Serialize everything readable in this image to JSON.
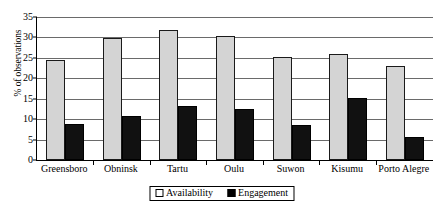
{
  "chart_data": {
    "type": "bar",
    "title": "",
    "xlabel": "",
    "ylabel": "% of observations",
    "ylim": [
      0,
      35
    ],
    "ytick_step": 5,
    "yticks": [
      0,
      5,
      10,
      15,
      20,
      25,
      30,
      35
    ],
    "grid": true,
    "legend_position": "bottom-center",
    "categories": [
      "Greensboro",
      "Obninsk",
      "Tartu",
      "Oulu",
      "Suwon",
      "Kisumu",
      "Porto Alegre"
    ],
    "series": [
      {
        "name": "Availability",
        "color": "#d4d4d4",
        "values": [
          24.4,
          29.9,
          31.8,
          30.4,
          25.3,
          26.0,
          23.1
        ]
      },
      {
        "name": "Engagement",
        "color": "#111111",
        "values": [
          8.9,
          10.8,
          13.1,
          12.5,
          8.5,
          15.1,
          5.6
        ]
      }
    ]
  }
}
